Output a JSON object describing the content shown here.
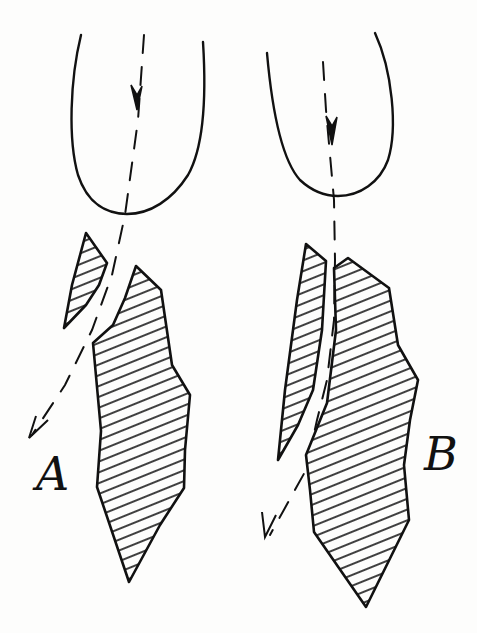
{
  "figure": {
    "panels": [
      {
        "id": "A",
        "label": "A",
        "description": "Tool/probe striking fragment; path deflected left past small fragment"
      },
      {
        "id": "B",
        "label": "B",
        "description": "Tool/probe striking fragment; path continues down channel between fragments"
      }
    ],
    "colors": {
      "ink": "#111111",
      "background": "#fdfdfc"
    }
  }
}
